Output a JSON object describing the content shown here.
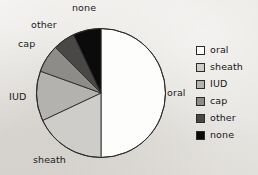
{
  "chart_data": {
    "type": "pie",
    "title": "",
    "subtitle": "",
    "xlabel": "",
    "ylabel": "",
    "grid": false,
    "legend_position": "right",
    "start_angle_deg": 0,
    "direction": "clockwise",
    "categories": [
      "oral",
      "sheath",
      "IUD",
      "cap",
      "other",
      "none"
    ],
    "values": [
      50.0,
      18.0,
      12.5,
      7.0,
      5.5,
      7.0
    ],
    "units": "percent",
    "slices": [
      {
        "label": "oral",
        "value": 50.0,
        "angle_deg": 180,
        "color": "#fdfdfb"
      },
      {
        "label": "sheath",
        "value": 18.0,
        "angle_deg": 65,
        "color": "#cfcdc9"
      },
      {
        "label": "IUD",
        "value": 12.5,
        "angle_deg": 45,
        "color": "#b4b2ae"
      },
      {
        "label": "cap",
        "value": 7.0,
        "angle_deg": 25,
        "color": "#8e8c89"
      },
      {
        "label": "other",
        "value": 5.5,
        "angle_deg": 20,
        "color": "#4a4846"
      },
      {
        "label": "none",
        "value": 7.0,
        "angle_deg": 25,
        "color": "#0b0b0b"
      }
    ],
    "annotations": [
      {
        "text": "none",
        "target": "none"
      },
      {
        "text": "other",
        "target": "other"
      },
      {
        "text": "cap",
        "target": "cap"
      },
      {
        "text": "IUD",
        "target": "IUD"
      },
      {
        "text": "sheath",
        "target": "sheath"
      },
      {
        "text": "oral",
        "target": "oral"
      }
    ]
  },
  "callouts": {
    "none": "none",
    "other": "other",
    "cap": "cap",
    "iud": "IUD",
    "sheath": "sheath",
    "oral": "oral"
  },
  "legend": {
    "items": [
      {
        "label": "oral",
        "color": "#fdfdfb"
      },
      {
        "label": "sheath",
        "color": "#cfcdc9"
      },
      {
        "label": "IUD",
        "color": "#b4b2ae"
      },
      {
        "label": "cap",
        "color": "#8e8c89"
      },
      {
        "label": "other",
        "color": "#4a4846"
      },
      {
        "label": "none",
        "color": "#0b0b0b"
      }
    ]
  },
  "colors": {
    "background": "#e7e5e1",
    "outline": "#2b2b2b",
    "text": "#151515"
  }
}
